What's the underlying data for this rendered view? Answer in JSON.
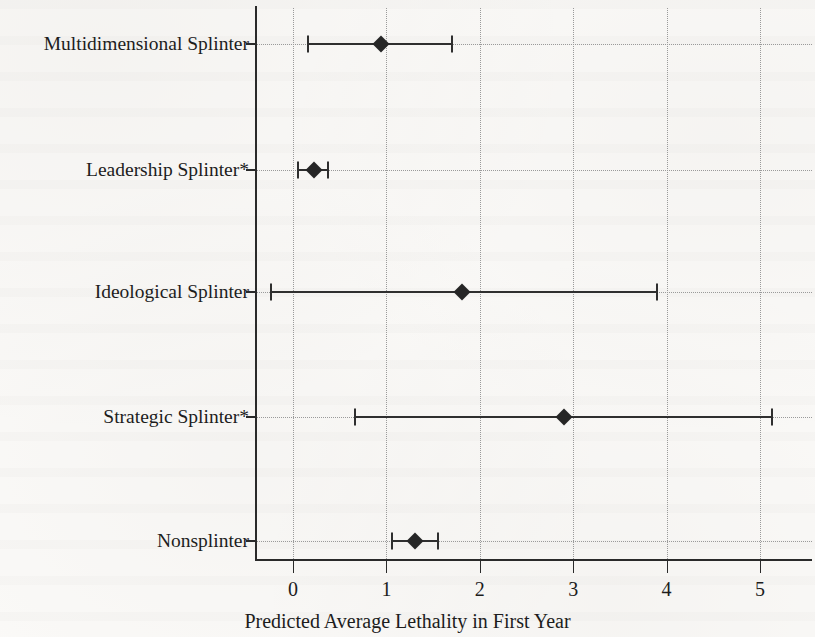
{
  "chart_data": {
    "type": "scatter",
    "subtype": "dot-and-whisker coefficient plot",
    "title": "",
    "xlabel": "Predicted Average Lethality in First Year",
    "ylabel": "",
    "xlim": [
      -0.45,
      5.6
    ],
    "xticks": [
      0,
      1,
      2,
      3,
      4,
      5
    ],
    "xtick_labels": [
      "0",
      "1",
      "2",
      "3",
      "4",
      "5"
    ],
    "grid": "dotted vertical gridlines at each x tick, dotted horizontal line at each category",
    "legend": "none",
    "categories": [
      "Multidimensional Splinter",
      "Leadership Splinter*",
      "Ideological Splinter",
      "Strategic Splinter*",
      "Nonsplinter"
    ],
    "values": [
      0.94,
      0.22,
      1.81,
      2.9,
      1.31
    ],
    "ci_low": [
      0.16,
      0.05,
      -0.24,
      0.66,
      1.06
    ],
    "ci_high": [
      1.7,
      0.37,
      3.9,
      5.13,
      1.55
    ],
    "point_color": "#262626",
    "line_color": "#2f2f2f",
    "grid_color": "#9a9a9a",
    "axis_color": "#2a2a2a",
    "note": "Asterisk in category label denotes statistical significance"
  }
}
